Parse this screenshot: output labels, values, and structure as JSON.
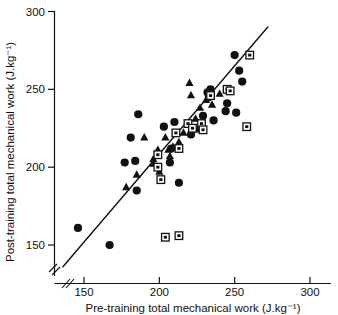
{
  "chart_data": {
    "type": "scatter",
    "title": "",
    "xlabel": "Pre-training total mechanical work (J.kg⁻¹)",
    "ylabel": "Post-training total mechanical work (J.kg⁻¹)",
    "xlim": [
      133,
      320
    ],
    "ylim": [
      133,
      305
    ],
    "xticks": [
      150,
      200,
      250,
      300
    ],
    "yticks": [
      150,
      200,
      250,
      300
    ],
    "xtick_labels": [
      "150",
      "200",
      "250",
      "300"
    ],
    "ytick_labels": [
      "150",
      "200",
      "250",
      "300"
    ],
    "grid": false,
    "legend_position": "none",
    "axis_break": {
      "x": true,
      "y": true,
      "note": "double slash break near origin on both axes"
    },
    "identity_line": {
      "label": "line of identity",
      "x": [
        136,
        272
      ],
      "y": [
        136,
        290
      ],
      "color": "#111111",
      "width": 1.4
    },
    "series": [
      {
        "name": "filled-circle",
        "marker": "circle",
        "color": "#111111",
        "points": [
          [
            146,
            161
          ],
          [
            167,
            150
          ],
          [
            177,
            203
          ],
          [
            181,
            219
          ],
          [
            184,
            204
          ],
          [
            185,
            185
          ],
          [
            186,
            234
          ],
          [
            203,
            226
          ],
          [
            207,
            203
          ],
          [
            208,
            212
          ],
          [
            210,
            229
          ],
          [
            213,
            190
          ],
          [
            221,
            221
          ],
          [
            232,
            248
          ],
          [
            233,
            245
          ],
          [
            233,
            247
          ],
          [
            234,
            250
          ],
          [
            229,
            233
          ],
          [
            236,
            230
          ],
          [
            245,
            241
          ],
          [
            245,
            250
          ],
          [
            244,
            236
          ],
          [
            250,
            272
          ],
          [
            251,
            235
          ],
          [
            255,
            255
          ],
          [
            253,
            262
          ]
        ]
      },
      {
        "name": "filled-triangle",
        "marker": "triangle",
        "color": "#111111",
        "points": [
          [
            178,
            187
          ],
          [
            185,
            195
          ],
          [
            190,
            219
          ],
          [
            196,
            202
          ],
          [
            199,
            211
          ],
          [
            200,
            197
          ],
          [
            204,
            219
          ],
          [
            206,
            211
          ],
          [
            209,
            213
          ],
          [
            213,
            216
          ],
          [
            216,
            222
          ],
          [
            219,
            227
          ],
          [
            220,
            254
          ],
          [
            221,
            246
          ],
          [
            224,
            231
          ],
          [
            225,
            224
          ],
          [
            227,
            238
          ],
          [
            231,
            243
          ],
          [
            235,
            240
          ],
          [
            240,
            247
          ],
          [
            207,
            207
          ],
          [
            196,
            205
          ]
        ]
      },
      {
        "name": "open-square",
        "marker": "square",
        "color": "#111111",
        "points": [
          [
            199,
            200
          ],
          [
            199,
            208
          ],
          [
            201,
            192
          ],
          [
            204,
            155
          ],
          [
            213,
            156
          ],
          [
            211,
            222
          ],
          [
            213,
            212
          ],
          [
            219,
            228
          ],
          [
            222,
            225
          ],
          [
            228,
            228
          ],
          [
            229,
            224
          ],
          [
            234,
            246
          ],
          [
            245,
            250
          ],
          [
            247,
            249
          ],
          [
            258,
            226
          ],
          [
            260,
            272
          ]
        ]
      }
    ]
  },
  "axes": {
    "y_title": "Post-training total mechanical work (J.kg⁻¹)",
    "x_title": "Pre-training total mechanical work (J.kg⁻¹)"
  },
  "ticks": {
    "y": [
      "300",
      "250",
      "200",
      "150"
    ],
    "x": [
      "150",
      "200",
      "250",
      "300"
    ]
  }
}
